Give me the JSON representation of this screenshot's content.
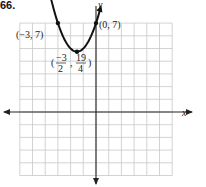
{
  "problem_number": "66.",
  "chart_data": {
    "type": "line",
    "title": "",
    "function": "y = x^2 + 3x + 7",
    "xlabel": "x",
    "ylabel": "y",
    "xlim": [
      -6,
      6
    ],
    "ylim": [
      -5,
      7
    ],
    "grid": true,
    "series": [
      {
        "name": "parabola",
        "x": [
          -3.9,
          -3,
          -2.5,
          -2,
          -1.5,
          -1,
          -0.5,
          0,
          0.5
        ],
        "values": [
          10.51,
          7,
          5.75,
          5,
          4.75,
          5,
          5.75,
          7,
          8.75
        ]
      }
    ],
    "points": [
      {
        "label": "(−3, 7)",
        "x": -3,
        "y": 7
      },
      {
        "label": "(0, 7)",
        "x": 0,
        "y": 7
      },
      {
        "label": "(−3/2, 19/4)",
        "x": -1.5,
        "y": 4.75
      }
    ]
  },
  "labels": {
    "x_axis": "x",
    "y_axis": "y",
    "p1": "(−3, 7)",
    "p2": "(0, 7)",
    "vertex_open": "(",
    "vertex_num1": "−3",
    "vertex_den1": "2",
    "vertex_comma": ",",
    "vertex_num2": "19",
    "vertex_den2": "4",
    "vertex_close": ")"
  }
}
